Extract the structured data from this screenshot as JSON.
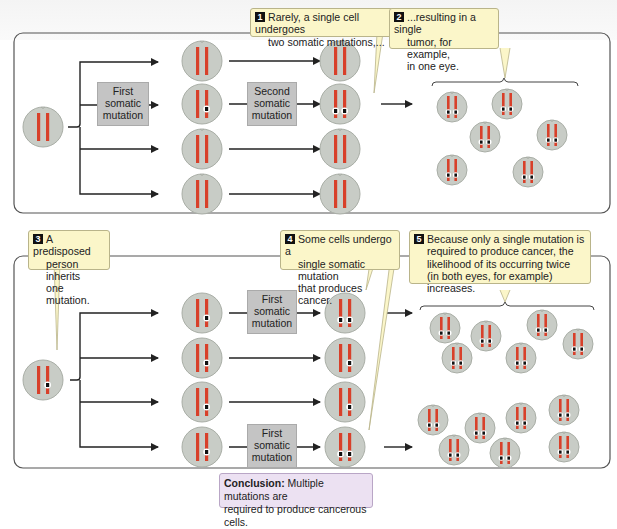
{
  "figure": {
    "top_panel": {
      "callouts": [
        {
          "number": "1",
          "text_line1": "Rarely, a single cell undergoes",
          "text_line2": "two somatic mutations,..."
        },
        {
          "number": "2",
          "text_line1": "...resulting in a single",
          "text_line2": "tumor, for example,",
          "text_line3": "in one eye."
        }
      ],
      "labels": {
        "first_mutation": [
          "First",
          "somatic",
          "mutation"
        ],
        "second_mutation": [
          "Second",
          "somatic",
          "mutation"
        ]
      },
      "tumor_cell_count": 6
    },
    "bottom_panel": {
      "callouts": [
        {
          "number": "3",
          "text_line1": "A predisposed",
          "text_line2": "person inherits",
          "text_line3": "one mutation."
        },
        {
          "number": "4",
          "text_line1": "Some cells undergo a",
          "text_line2": "single somatic mutation",
          "text_line3": "that produces cancer."
        },
        {
          "number": "5",
          "text_line1": "Because only a single mutation is",
          "text_line2": "required to produce cancer, the",
          "text_line3": "likelihood of its occurring twice",
          "text_line4": "(in both eyes, for example) increases."
        }
      ],
      "labels": {
        "first_mutation_a": [
          "First",
          "somatic",
          "mutation"
        ],
        "first_mutation_b": [
          "First",
          "somatic",
          "mutation"
        ]
      },
      "tumor_cell_count_upper": 6,
      "tumor_cell_count_lower": 7
    },
    "conclusion": {
      "label": "Conclusion:",
      "text_line1": " Multiple mutations are",
      "text_line2": "required to produce cancerous cells."
    },
    "colors": {
      "cell_fill": "#c8ccc6",
      "chromosome": "#d8402a",
      "callout_bg": "#fbf6c9",
      "mutation_box_bg": "#c4c4c4",
      "conclusion_bg": "#ece1f2"
    }
  }
}
